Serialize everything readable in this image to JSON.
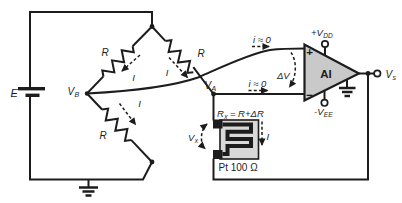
{
  "bridge": {
    "source_label": "E",
    "resistor_top_left": "R",
    "resistor_top_right": "R",
    "resistor_bottom_left": "R",
    "current_top_left": "I",
    "current_top_right": "I",
    "current_bottom_left": "I",
    "node_left": {
      "base": "V",
      "sub": "B"
    },
    "node_right": {
      "base": "V",
      "sub": "A"
    }
  },
  "amplifier": {
    "label": "AI",
    "noninverting_mark": "+",
    "inverting_mark": "−",
    "bias_current_top": "i ≈ 0",
    "bias_current_bottom": "i ≈ 0",
    "differential_voltage": "ΔV",
    "positive_supply": {
      "base": "+V",
      "sub": "DD"
    },
    "negative_supply": {
      "base": "-V",
      "sub": "EE"
    },
    "output": {
      "base": "V",
      "sub": "s"
    }
  },
  "sensor": {
    "resistance": {
      "base": "R",
      "sub": "x",
      "equation": "= R+ΔR"
    },
    "voltage": {
      "base": "V",
      "sub": "x"
    },
    "current": "I",
    "device_label": "Pt 100 Ω"
  },
  "colors": {
    "line": "#1c1c1c",
    "amplifier_fill": "#c9c9c9",
    "sensor_fill": "#d8d8d8"
  }
}
